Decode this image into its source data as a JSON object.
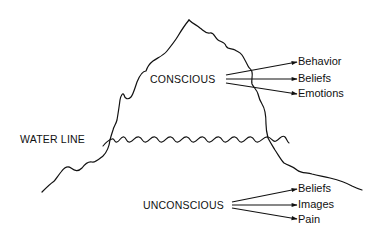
{
  "diagram": {
    "type": "iceberg-metaphor",
    "colors": {
      "ink": "#111111",
      "background": "#ffffff"
    },
    "water_line": {
      "label": "WATER LINE"
    },
    "conscious": {
      "label": "CONSCIOUS",
      "items": [
        {
          "label": "Behavior"
        },
        {
          "label": "Beliefs"
        },
        {
          "label": "Emotions"
        }
      ]
    },
    "unconscious": {
      "label": "UNCONSCIOUS",
      "items": [
        {
          "label": "Beliefs"
        },
        {
          "label": "Images"
        },
        {
          "label": "Pain"
        }
      ]
    }
  }
}
